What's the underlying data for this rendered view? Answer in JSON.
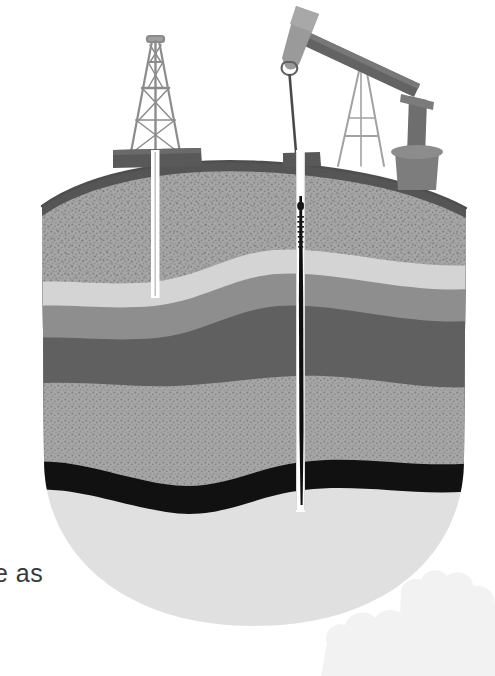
{
  "page": {
    "background_color": "#ffffff",
    "text_fragment": "e as",
    "text_fragment_color": "#3a3a3a"
  },
  "illustration": {
    "title": "Oil well cross-section",
    "description": "Grayscale cutaway diagram of subsurface rock strata with a drilling derrick and a pumpjack at the surface and two wellbores descending to an oil-bearing layer",
    "style": "halftone grayscale print illustration"
  },
  "strata": [
    {
      "name": "topsoil-overburden",
      "label": "Topsoil / overburden",
      "color": "#a6a6a6",
      "texture": "speckled",
      "order": 1
    },
    {
      "name": "upper-light-band",
      "label": "Light sedimentary band",
      "color": "#d4d4d4",
      "texture": "smooth",
      "order": 2
    },
    {
      "name": "medium-gray-band",
      "label": "Medium gray rock band",
      "color": "#8e8e8e",
      "texture": "smooth",
      "order": 3
    },
    {
      "name": "dark-gray-band",
      "label": "Dark gray impermeable cap rock",
      "color": "#606060",
      "texture": "smooth",
      "order": 4
    },
    {
      "name": "lower-speckled-band",
      "label": "Lower porous sandstone",
      "color": "#a6a6a6",
      "texture": "speckled",
      "order": 5
    },
    {
      "name": "oil-reservoir",
      "label": "Oil reservoir",
      "color": "#111111",
      "texture": "smooth",
      "order": 6
    },
    {
      "name": "basement-layer",
      "label": "Basement bedrock",
      "color": "#e0e0e0",
      "texture": "smooth",
      "order": 7
    }
  ],
  "ground": {
    "rim_color": "#5a5a5a",
    "outline_color": "#6b6b6b"
  },
  "surface_equipment": [
    {
      "name": "drilling-derrick",
      "label": "Drilling derrick",
      "color": "#8c8c8c",
      "position": "left"
    },
    {
      "name": "derrick-platform",
      "label": "Derrick platform",
      "color": "#595959",
      "position": "left"
    },
    {
      "name": "pumpjack",
      "label": "Pumpjack",
      "color": "#6e6e6e",
      "position": "right"
    },
    {
      "name": "pumpjack-horsehead",
      "label": "Horsehead",
      "color": "#8f8f8f",
      "position": "right"
    },
    {
      "name": "pumpjack-walking-beam",
      "label": "Walking beam",
      "color": "#636363",
      "position": "right"
    },
    {
      "name": "pumpjack-samson-post",
      "label": "Samson post A-frame",
      "color": "#9a9a9a",
      "position": "right"
    },
    {
      "name": "pumpjack-counterweight",
      "label": "Crank and counterweight housing",
      "color": "#6e6e6e",
      "position": "right"
    },
    {
      "name": "storage-tank",
      "label": "Storage tank",
      "color": "#7d7d7d",
      "position": "right"
    },
    {
      "name": "wellhead",
      "label": "Wellhead",
      "color": "#595959",
      "position": "right"
    }
  ],
  "wellbores": [
    {
      "name": "exploration-well",
      "label": "Exploration well",
      "casing_color": "#ffffff",
      "position": "left",
      "depth": "shallow"
    },
    {
      "name": "production-well",
      "label": "Production well",
      "casing_color": "#ffffff",
      "rod_color": "#0d0d0d",
      "position": "right",
      "depth": "deep — reaches oil reservoir"
    }
  ]
}
